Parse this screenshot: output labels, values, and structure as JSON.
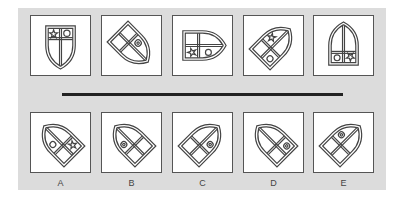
{
  "puzzle": {
    "type": "shield-rotation-sequence",
    "question_row": [
      {
        "id": "q1",
        "rotation": 0,
        "symbols": [
          "star-top-left",
          "circle-top-right"
        ]
      },
      {
        "id": "q2",
        "rotation": -45,
        "symbols": [
          "soccer-ball-right"
        ]
      },
      {
        "id": "q3",
        "rotation": -90,
        "symbols": [
          "star-bottom-left",
          "circle-bottom-right"
        ]
      },
      {
        "id": "q4",
        "rotation": -135,
        "symbols": [
          "star-top",
          "circle-bottom"
        ]
      },
      {
        "id": "q5",
        "rotation": 180,
        "symbols": [
          "circle-bottom-left",
          "star-bottom-right"
        ]
      }
    ],
    "answers": [
      {
        "label": "A",
        "symbols": [
          "circle-top",
          "star-bottom"
        ]
      },
      {
        "label": "B",
        "symbols": [
          "soccer-ball-top"
        ]
      },
      {
        "label": "C",
        "symbols": [
          "soccer-ball-right"
        ]
      },
      {
        "label": "D",
        "symbols": [
          "soccer-ball-left"
        ]
      },
      {
        "label": "E",
        "symbols": [
          "soccer-ball-top"
        ]
      }
    ]
  },
  "colors": {
    "panel": "#dcdcdc",
    "stroke": "#444444",
    "rule": "#222222"
  }
}
